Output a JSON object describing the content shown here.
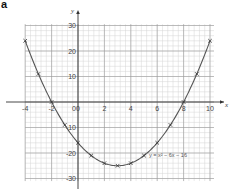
{
  "panel_label": "a",
  "chart_data": {
    "type": "line",
    "title": "",
    "xlabel": "x",
    "ylabel": "y",
    "xlim": [
      -4,
      10
    ],
    "ylim": [
      -30,
      30
    ],
    "grid": true,
    "x_ticks": [
      -4,
      -2,
      0,
      2,
      4,
      6,
      8,
      10
    ],
    "y_ticks": [
      30,
      20,
      10,
      0,
      -10,
      -20,
      -30
    ],
    "x_tick_labels": [
      "-4",
      "-2",
      "0",
      "2",
      "4",
      "6",
      "8",
      "10"
    ],
    "y_tick_labels": [
      "30",
      "20",
      "10",
      "0",
      "-10",
      "-20",
      "-30"
    ],
    "series": [
      {
        "name": "y = x² − 6x − 16",
        "marker": "x",
        "x": [
          -4,
          -3,
          -2,
          -1,
          0,
          1,
          2,
          3,
          4,
          5,
          6,
          7,
          8,
          9,
          10
        ],
        "values": [
          24,
          11,
          0,
          -9,
          -16,
          -21,
          -24,
          -25,
          -24,
          -21,
          -16,
          -9,
          0,
          11,
          24
        ]
      }
    ],
    "annotations": [
      {
        "text": "y = x² − 6x − 16",
        "x": 5.6,
        "y": -21
      }
    ],
    "colors": {
      "curve": "#555555",
      "grid_major": "#9a9a9a",
      "grid_minor": "#d4d4d4",
      "axis": "#333333"
    }
  }
}
